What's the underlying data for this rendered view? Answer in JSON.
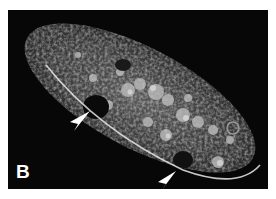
{
  "figure": {
    "panel_label": "B",
    "annotations": [
      {
        "type": "arrowhead",
        "name": "arrowhead-upper",
        "color": "#ffffff"
      },
      {
        "type": "arrowhead",
        "name": "arrowhead-lower",
        "color": "#ffffff"
      }
    ],
    "colors": {
      "background": "#070707",
      "page": "#ffffff",
      "cell_edge": "#e8e8e8"
    }
  }
}
